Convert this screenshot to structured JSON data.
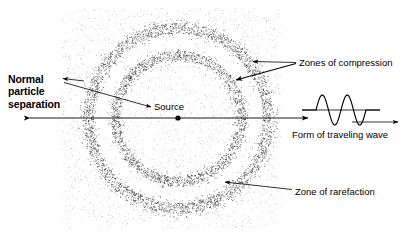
{
  "figure": {
    "type": "physics-diagram",
    "background_color": "#ffffff",
    "ink_color": "#000000",
    "stipple_color": "#555555"
  },
  "labels": {
    "normal_separation": {
      "line1": "Normal",
      "line2": "particle",
      "line3": "separation",
      "style": "bold"
    },
    "source": "Source",
    "zones_of_compression": "Zones of compression",
    "form_of_traveling_wave": "Form of traveling wave",
    "zone_of_rarefaction": "Zone of rarefaction"
  },
  "diagram": {
    "medium_field": {
      "name": "particle-stipple-field",
      "x": 62,
      "y": 8,
      "width": 219,
      "height": 220,
      "base_particle_count": 4200
    },
    "source_point": {
      "cx": 178,
      "cy": 118,
      "r": 2.6
    },
    "compression_rings": [
      {
        "name": "inner-compression-ring",
        "radius": 63,
        "thickness": 9
      },
      {
        "name": "outer-compression-ring",
        "radius": 90,
        "thickness": 10
      }
    ],
    "rarefaction_ring": {
      "name": "rarefaction-zone",
      "radius": 77,
      "thickness": 16
    },
    "axis_arrow": {
      "x1": 28,
      "y1": 118,
      "x2": 310,
      "y2": 118,
      "double_headed": true
    },
    "leader_lines": [
      {
        "name": "normal-separation-short-leader",
        "x1": 62,
        "y1": 79,
        "x2": 82,
        "y2": 82
      },
      {
        "name": "normal-separation-long-leader",
        "x1": 64,
        "y1": 83,
        "x2": 152,
        "y2": 108
      },
      {
        "name": "compression-leader-upper",
        "x1": 296,
        "y1": 63,
        "x2": 252,
        "y2": 62
      },
      {
        "name": "compression-leader-lower",
        "x1": 296,
        "y1": 64,
        "x2": 234,
        "y2": 81
      },
      {
        "name": "rarefaction-leader",
        "x1": 292,
        "y1": 190,
        "x2": 223,
        "y2": 182
      }
    ]
  },
  "chart_data": {
    "type": "line",
    "title": "Form of traveling wave",
    "xlabel": "",
    "ylabel": "",
    "cycles": 2,
    "amplitude": 15,
    "baseline_y": 110,
    "x_start": 302,
    "x_end": 380,
    "wave_start": 316,
    "wave_end": 366,
    "propagation_arrow": {
      "x1": 352,
      "y1": 122,
      "x2": 400,
      "y2": 122,
      "direction": "right"
    },
    "x": [
      0,
      0.125,
      0.25,
      0.375,
      0.5,
      0.625,
      0.75,
      0.875,
      1.0
    ],
    "values": [
      0,
      1,
      0,
      -1,
      0,
      1,
      0,
      -1,
      0
    ],
    "ylim": [
      -1,
      1
    ],
    "grid": false,
    "legend": false
  }
}
